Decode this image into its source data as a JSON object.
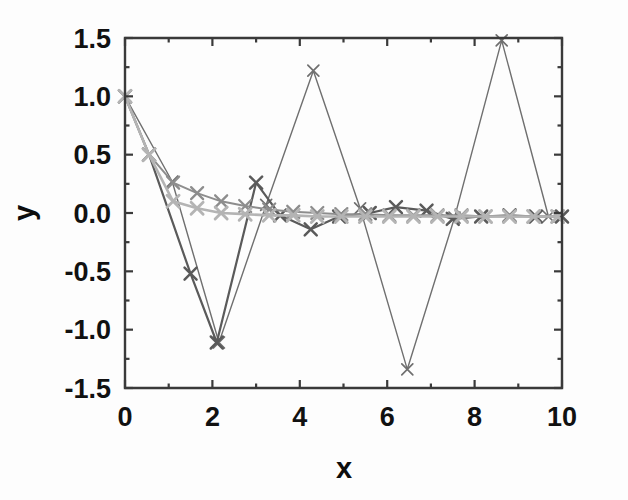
{
  "chart_data": {
    "type": "line",
    "title": "",
    "subtitle": "",
    "xlabel": "x",
    "ylabel": "y",
    "xlim": [
      0,
      10
    ],
    "ylim": [
      -1.5,
      1.5
    ],
    "xticks": [
      0,
      2,
      4,
      6,
      8,
      10
    ],
    "xtick_labels": [
      "0",
      "2",
      "4",
      "6",
      "8",
      "10"
    ],
    "yticks": [
      -1.5,
      -1.0,
      -0.5,
      0.0,
      0.5,
      1.0,
      1.5
    ],
    "ytick_labels": [
      "-1.5",
      "-1.0",
      "-0.5",
      "0.0",
      "0.5",
      "1.0",
      "1.5"
    ],
    "minor_xticks": [
      1,
      3,
      5,
      7,
      9
    ],
    "minor_yticks": [
      -1.25,
      -0.75,
      -0.25,
      0.25,
      0.75,
      1.25
    ],
    "grid": false,
    "legend": false,
    "legend_position": "none",
    "marker": "x",
    "background": "#fdfdfd",
    "series": [
      {
        "name": "series-1",
        "color": "#6f6f6f",
        "linewidth": 1.4,
        "marker_size": 11,
        "x": [
          0.0,
          1.08,
          2.15,
          3.23,
          4.31,
          5.38,
          6.46,
          7.54,
          8.62,
          9.69
        ],
        "y": [
          1.0,
          0.27,
          -1.11,
          0.07,
          1.22,
          0.04,
          -1.34,
          -0.04,
          1.48,
          -0.03
        ]
      },
      {
        "name": "series-2",
        "color": "#5a5a5a",
        "linewidth": 2.2,
        "marker_size": 12,
        "x": [
          0.0,
          0.55,
          1.5,
          2.1,
          3.0,
          3.55,
          4.25,
          4.9,
          5.6,
          6.2,
          6.9,
          7.5,
          8.15,
          8.8,
          9.4,
          10.0
        ],
        "y": [
          1.0,
          0.5,
          -0.52,
          -1.11,
          0.26,
          -0.02,
          -0.14,
          -0.03,
          0.0,
          0.05,
          0.02,
          -0.05,
          -0.03,
          -0.02,
          -0.03,
          -0.03
        ]
      },
      {
        "name": "series-3",
        "color": "#8d8d8d",
        "linewidth": 2.0,
        "marker_size": 12,
        "x": [
          0.0,
          0.55,
          1.1,
          1.65,
          2.2,
          2.75,
          3.3,
          3.85,
          4.4,
          4.95,
          5.5,
          6.05,
          6.6,
          7.15,
          7.7,
          8.25,
          8.8,
          9.35,
          9.9
        ],
        "y": [
          1.0,
          0.5,
          0.26,
          0.17,
          0.1,
          0.06,
          0.03,
          0.01,
          0.0,
          -0.01,
          -0.01,
          -0.02,
          -0.02,
          -0.02,
          -0.02,
          -0.03,
          -0.03,
          -0.03,
          -0.03
        ]
      },
      {
        "name": "series-4",
        "color": "#b4b4b4",
        "linewidth": 2.6,
        "marker_size": 12,
        "x": [
          0.0,
          0.55,
          1.1,
          1.65,
          2.2,
          2.75,
          3.3,
          3.85,
          4.4,
          4.95,
          5.5,
          6.05,
          6.6,
          7.15,
          7.7,
          8.25,
          8.8,
          9.35,
          9.9
        ],
        "y": [
          1.0,
          0.5,
          0.1,
          0.04,
          0.0,
          -0.01,
          -0.02,
          -0.02,
          -0.03,
          -0.03,
          -0.03,
          -0.03,
          -0.03,
          -0.03,
          -0.03,
          -0.03,
          -0.03,
          -0.03,
          -0.03
        ]
      }
    ]
  },
  "axes": {
    "x_title": "x",
    "y_title": "y"
  }
}
